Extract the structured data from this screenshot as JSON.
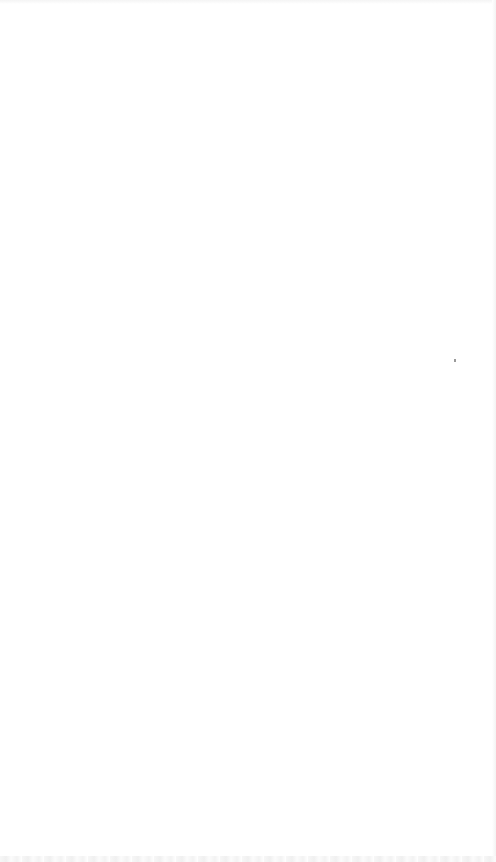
{
  "page": {
    "background_color": "#ffffff",
    "content": "blank"
  }
}
